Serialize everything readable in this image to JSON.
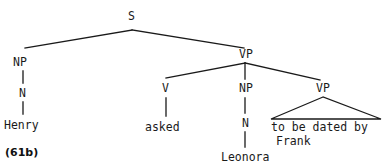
{
  "figure": {
    "example_number": "(61b)",
    "background_color": "#ffffff",
    "ink_color": "#1a1a1a"
  },
  "tree": {
    "nodes": [
      {
        "id": "s",
        "label": "S",
        "x": 132,
        "y": 21,
        "kind": "category"
      },
      {
        "id": "np1",
        "label": "NP",
        "x": 23,
        "y": 67,
        "kind": "category"
      },
      {
        "id": "n1",
        "label": "N",
        "x": 23,
        "y": 98,
        "kind": "category"
      },
      {
        "id": "vp1",
        "label": "VP",
        "x": 246,
        "y": 59,
        "kind": "category"
      },
      {
        "id": "v1",
        "label": "V",
        "x": 166,
        "y": 93,
        "kind": "category"
      },
      {
        "id": "np2",
        "label": "NP",
        "x": 246,
        "y": 93,
        "kind": "category"
      },
      {
        "id": "n2",
        "label": "N",
        "x": 246,
        "y": 128,
        "kind": "category"
      },
      {
        "id": "vp2",
        "label": "VP",
        "x": 324,
        "y": 93,
        "kind": "category"
      }
    ],
    "leaves": [
      {
        "id": "henry",
        "label": "Henry",
        "x": 23,
        "y": 130
      },
      {
        "id": "asked",
        "label": "asked",
        "x": 166,
        "y": 132
      },
      {
        "id": "leonora",
        "label": "Leonora",
        "x": 249,
        "y": 163
      },
      {
        "id": "tobedatedby",
        "label": "to be dated by",
        "x": 272,
        "y": 133
      },
      {
        "id": "frank",
        "label": "Frank",
        "x": 277,
        "y": 147
      }
    ]
  }
}
